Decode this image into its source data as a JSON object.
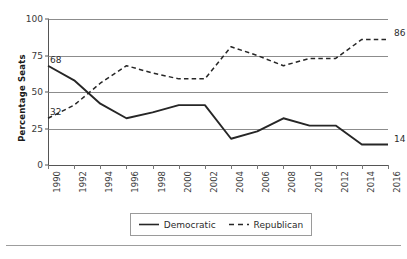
{
  "chart_data": {
    "type": "line",
    "title": "",
    "xlabel": "",
    "ylabel": "Percentage Seats",
    "x": [
      1990,
      1992,
      1994,
      1996,
      1998,
      2000,
      2002,
      2004,
      2006,
      2008,
      2010,
      2012,
      2014,
      2016
    ],
    "xtick_labels": [
      "1990",
      "1992",
      "1994",
      "1996",
      "1998",
      "2000",
      "2002",
      "2004",
      "2006",
      "2008",
      "2010",
      "2012",
      "2014",
      "2016"
    ],
    "ytick_labels": [
      "0",
      "25",
      "50",
      "75",
      "100"
    ],
    "yticks": [
      0,
      25,
      50,
      75,
      100
    ],
    "ylim": [
      0,
      100
    ],
    "xlim": [
      1990,
      2016
    ],
    "grid": true,
    "legend_position": "bottom-center",
    "series": [
      {
        "name": "Democratic",
        "style": "solid",
        "color": "#262626",
        "values": [
          68,
          58,
          42,
          32,
          36,
          41,
          41,
          18,
          23,
          32,
          27,
          27,
          14,
          14
        ]
      },
      {
        "name": "Republican",
        "style": "dashed",
        "color": "#262626",
        "values": [
          32,
          41,
          56,
          68,
          63,
          59,
          59,
          81,
          75,
          68,
          73,
          73,
          86,
          86
        ]
      }
    ],
    "annotations": [
      {
        "text": "68",
        "series": "Democratic",
        "x": 1990,
        "y": 68,
        "position": "left"
      },
      {
        "text": "32",
        "series": "Republican",
        "x": 1990,
        "y": 32,
        "position": "left"
      },
      {
        "text": "86",
        "series": "Republican",
        "x": 2016,
        "y": 86,
        "position": "right"
      },
      {
        "text": "14",
        "series": "Democratic",
        "x": 2016,
        "y": 14,
        "position": "right"
      }
    ]
  },
  "legend": {
    "items": [
      {
        "label": "Democratic",
        "style": "solid"
      },
      {
        "label": "Republican",
        "style": "dashed"
      }
    ]
  }
}
